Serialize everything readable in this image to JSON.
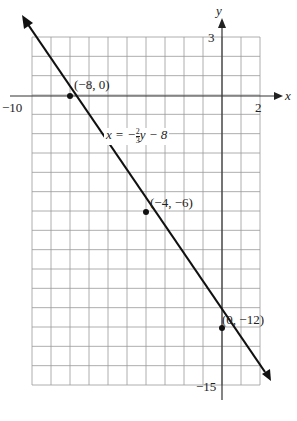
{
  "chart_data": {
    "type": "line",
    "title": "",
    "xlabel": "x",
    "ylabel": "y",
    "xlim": [
      -10,
      2
    ],
    "ylim": [
      -15,
      3
    ],
    "grid": true,
    "tick_labels": {
      "x_min": "−10",
      "x_max": "2",
      "y_max": "3",
      "y_min": "−15"
    },
    "equation": {
      "lhs": "x = −",
      "num": "2",
      "den": "3",
      "rhs": "y − 8"
    },
    "series": [
      {
        "name": "x = -2/3 y - 8",
        "x": [
          -8,
          -4,
          0
        ],
        "y": [
          0,
          -6,
          -12
        ]
      }
    ],
    "points": [
      {
        "label": "(−8, 0)",
        "x": -8,
        "y": 0
      },
      {
        "label": "(−4, −6)",
        "x": -4,
        "y": -6
      },
      {
        "label": "(0, −12)",
        "x": 0,
        "y": -12
      }
    ]
  }
}
